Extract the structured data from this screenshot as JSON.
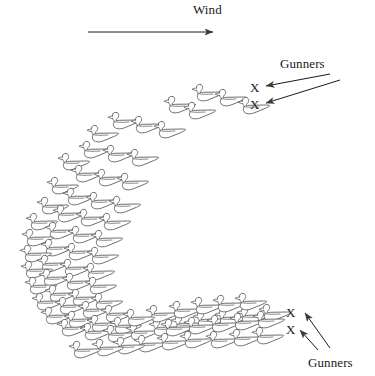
{
  "figure": {
    "type": "diagram",
    "background_color": "#ffffff",
    "line_color": "#555555",
    "text_color": "#1a1a1a",
    "width": 375,
    "height": 376
  },
  "labels": {
    "wind": "Wind",
    "gunners_top": "Gunners",
    "gunners_bottom": "Gunners",
    "gunner_marker": "X"
  },
  "wind_arrow": {
    "x1": 88,
    "y1": 32,
    "x2": 213,
    "y2": 32,
    "direction": "left-to-right"
  },
  "gunner_positions": [
    {
      "id": "gunner-top-1",
      "x": 254,
      "y": 86,
      "marker": "X"
    },
    {
      "id": "gunner-top-2",
      "x": 254,
      "y": 103,
      "marker": "X"
    },
    {
      "id": "gunner-bottom-1",
      "x": 290,
      "y": 311,
      "marker": "X"
    },
    {
      "id": "gunner-bottom-2",
      "x": 290,
      "y": 328,
      "marker": "X"
    }
  ],
  "gunner_arrows": [
    {
      "from_x": 330,
      "from_y": 74,
      "to_x": 266,
      "to_y": 86
    },
    {
      "from_x": 340,
      "from_y": 80,
      "to_x": 266,
      "to_y": 103
    },
    {
      "from_x": 330,
      "from_y": 348,
      "to_x": 305,
      "to_y": 313
    },
    {
      "from_x": 318,
      "from_y": 350,
      "to_x": 300,
      "to_y": 330
    }
  ],
  "decoys": {
    "count": 82,
    "facing": "left",
    "positions": [
      [
        191,
        83
      ],
      [
        214,
        88
      ],
      [
        163,
        95
      ],
      [
        237,
        96
      ],
      [
        183,
        101
      ],
      [
        107,
        111
      ],
      [
        130,
        115
      ],
      [
        153,
        120
      ],
      [
        86,
        124
      ],
      [
        78,
        140
      ],
      [
        102,
        144
      ],
      [
        126,
        148
      ],
      [
        57,
        152
      ],
      [
        70,
        164
      ],
      [
        93,
        168
      ],
      [
        116,
        172
      ],
      [
        46,
        176
      ],
      [
        62,
        187
      ],
      [
        85,
        191
      ],
      [
        108,
        195
      ],
      [
        36,
        196
      ],
      [
        52,
        204
      ],
      [
        75,
        208
      ],
      [
        98,
        212
      ],
      [
        25,
        212
      ],
      [
        44,
        221
      ],
      [
        67,
        225
      ],
      [
        90,
        229
      ],
      [
        21,
        228
      ],
      [
        40,
        238
      ],
      [
        63,
        242
      ],
      [
        86,
        246
      ],
      [
        19,
        244
      ],
      [
        36,
        254
      ],
      [
        59,
        258
      ],
      [
        82,
        262
      ],
      [
        20,
        260
      ],
      [
        38,
        268
      ],
      [
        61,
        272
      ],
      [
        84,
        276
      ],
      [
        24,
        276
      ],
      [
        44,
        284
      ],
      [
        67,
        288
      ],
      [
        90,
        292
      ],
      [
        31,
        292
      ],
      [
        54,
        296
      ],
      [
        77,
        300
      ],
      [
        100,
        304
      ],
      [
        40,
        306
      ],
      [
        63,
        310
      ],
      [
        86,
        314
      ],
      [
        109,
        316
      ],
      [
        56,
        318
      ],
      [
        79,
        322
      ],
      [
        102,
        324
      ],
      [
        125,
        322
      ],
      [
        148,
        318
      ],
      [
        145,
        304
      ],
      [
        122,
        308
      ],
      [
        170,
        314
      ],
      [
        168,
        300
      ],
      [
        192,
        310
      ],
      [
        190,
        296
      ],
      [
        214,
        308
      ],
      [
        212,
        294
      ],
      [
        236,
        306
      ],
      [
        234,
        292
      ],
      [
        258,
        303
      ],
      [
        133,
        334
      ],
      [
        156,
        332
      ],
      [
        179,
        330
      ],
      [
        160,
        318
      ],
      [
        183,
        316
      ],
      [
        206,
        314
      ],
      [
        229,
        312
      ],
      [
        252,
        310
      ],
      [
        205,
        330
      ],
      [
        228,
        328
      ],
      [
        251,
        326
      ],
      [
        112,
        336
      ],
      [
        91,
        338
      ],
      [
        68,
        340
      ]
    ]
  }
}
